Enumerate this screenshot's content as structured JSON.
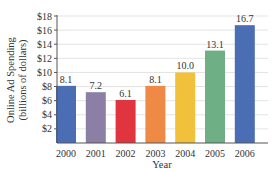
{
  "chart_data": {
    "type": "bar",
    "title": "",
    "xlabel": "Year",
    "ylabel": "Online Ad Spending",
    "ylabel_line2": "(billions of dollars)",
    "categories": [
      "2000",
      "2001",
      "2002",
      "2003",
      "2004",
      "2005",
      "2006"
    ],
    "values": [
      8.1,
      7.2,
      6.1,
      8.1,
      10.0,
      13.1,
      16.7
    ],
    "value_labels": [
      "8.1",
      "7.2",
      "6.1",
      "8.1",
      "10.0",
      "13.1",
      "16.7"
    ],
    "bar_colors": [
      "#4a6db3",
      "#8c7fa6",
      "#e0353f",
      "#ee8a45",
      "#f1c13c",
      "#6faf86",
      "#4a6db3"
    ],
    "ylim": [
      0,
      18
    ],
    "yticks": [
      2,
      4,
      6,
      8,
      10,
      12,
      14,
      16,
      18
    ],
    "ytick_labels": [
      "$2",
      "$4",
      "$6",
      "$8",
      "$10",
      "$12",
      "$14",
      "$16",
      "$18"
    ],
    "grid": true,
    "legend": null
  }
}
